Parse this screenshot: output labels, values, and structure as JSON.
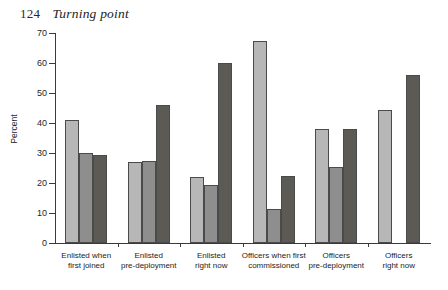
{
  "page": {
    "folio": "124",
    "running_head": "Turning point"
  },
  "chart_data": {
    "type": "bar",
    "title": "",
    "xlabel": "",
    "ylabel": "Percent",
    "ylim": [
      0,
      70
    ],
    "ytick_step": 10,
    "yticks": [
      0,
      10,
      20,
      30,
      40,
      50,
      60,
      70
    ],
    "ytick_labels": [
      "0",
      "10",
      "20",
      "30",
      "40",
      "50",
      "60",
      "70"
    ],
    "grid": false,
    "legend_position": "none",
    "categories": [
      "Enlisted when\nfirst joined",
      "Enlisted\npre-deployment",
      "Enlisted\nright now",
      "Officers when first\ncommissioned",
      "Officers\npre-deployment",
      "Officers\nright now"
    ],
    "series": [
      {
        "name": "series-1",
        "color": "#b7b7b7",
        "values": [
          41,
          27,
          22,
          67.5,
          38,
          44.5
        ]
      },
      {
        "name": "series-2",
        "color": "#8e8e8e",
        "values": [
          30,
          27.5,
          19.5,
          11.5,
          25.5,
          null
        ]
      },
      {
        "name": "series-3",
        "color": "#5c5a55",
        "values": [
          29.5,
          46,
          60,
          22.5,
          38,
          56
        ]
      }
    ]
  }
}
